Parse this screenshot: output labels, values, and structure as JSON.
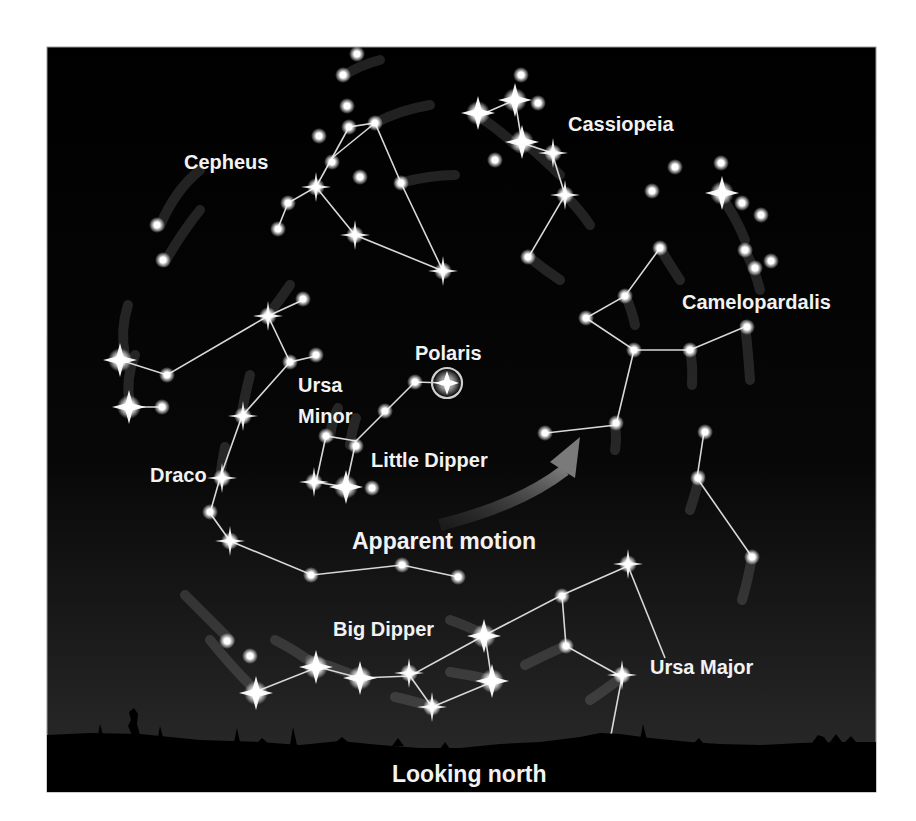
{
  "figure": {
    "type": "sky-chart",
    "view_label": "Looking north",
    "colors": {
      "sky_top": "#000000",
      "sky_bottom": "#2a2a2a",
      "ground": "#000000",
      "star": "#ffffff",
      "line": "#d8d8d8",
      "label": "#f2f2f2",
      "arrow": "#6e6e6e",
      "page": "#ffffff"
    }
  },
  "labels": {
    "cepheus": "Cepheus",
    "cassiopeia": "Cassiopeia",
    "camelopardalis": "Camelopardalis",
    "polaris": "Polaris",
    "ursa_minor_1": "Ursa",
    "ursa_minor_2": "Minor",
    "little_dipper": "Little Dipper",
    "draco": "Draco",
    "apparent_motion": "Apparent motion",
    "big_dipper": "Big Dipper",
    "ursa_major": "Ursa Major",
    "looking_north": "Looking north"
  },
  "constellations": [
    "Cepheus",
    "Cassiopeia",
    "Camelopardalis",
    "Ursa Minor",
    "Draco",
    "Ursa Major"
  ],
  "asterisms": [
    "Little Dipper",
    "Big Dipper"
  ],
  "highlighted_star": "Polaris"
}
